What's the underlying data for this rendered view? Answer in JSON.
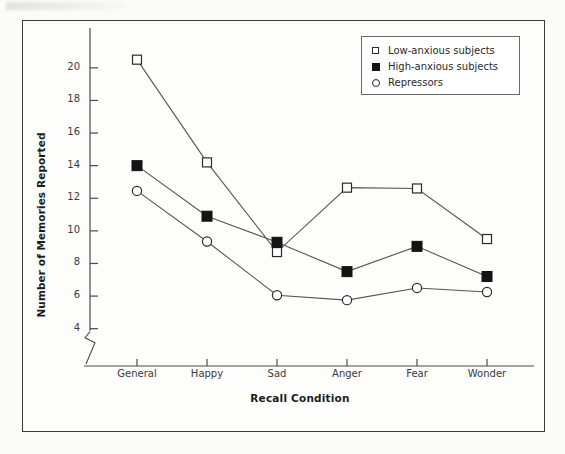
{
  "chart_data": {
    "type": "line",
    "title": "",
    "xlabel": "Recall Condition",
    "ylabel": "Number of Memories Reported",
    "categories": [
      "General",
      "Happy",
      "Sad",
      "Anger",
      "Fear",
      "Wonder"
    ],
    "ylim": [
      3.0,
      21.4
    ],
    "yticks": [
      4,
      6,
      8,
      10,
      12,
      14,
      16,
      18,
      20
    ],
    "ytick_labels": [
      "4",
      "6",
      "8",
      "10",
      "12",
      "14",
      "16",
      "18",
      "20"
    ],
    "axis_break": true,
    "grid": false,
    "legend_position": "top-right",
    "series": [
      {
        "name": "Low-anxious subjects",
        "marker": "open-square",
        "color": "#2a2a2a",
        "fill": "#ffffff",
        "values": [
          20.5,
          14.2,
          8.7,
          12.65,
          12.6,
          9.5
        ]
      },
      {
        "name": "High-anxious subjects",
        "marker": "filled-square",
        "color": "#141414",
        "fill": "#141414",
        "values": [
          14.0,
          10.9,
          9.3,
          7.5,
          9.05,
          7.2
        ]
      },
      {
        "name": "Repressors",
        "marker": "open-circle",
        "color": "#2a2a2a",
        "fill": "#ffffff",
        "values": [
          12.45,
          9.35,
          6.05,
          5.75,
          6.5,
          6.25
        ]
      }
    ]
  },
  "legend": {
    "items": [
      {
        "label": "Low-anxious subjects",
        "marker": "open-square"
      },
      {
        "label": "High-anxious subjects",
        "marker": "filled-square"
      },
      {
        "label": "Repressors",
        "marker": "open-circle"
      }
    ]
  },
  "axes": {
    "y_title": "Number of Memories Reported",
    "x_title": "Recall Condition"
  }
}
